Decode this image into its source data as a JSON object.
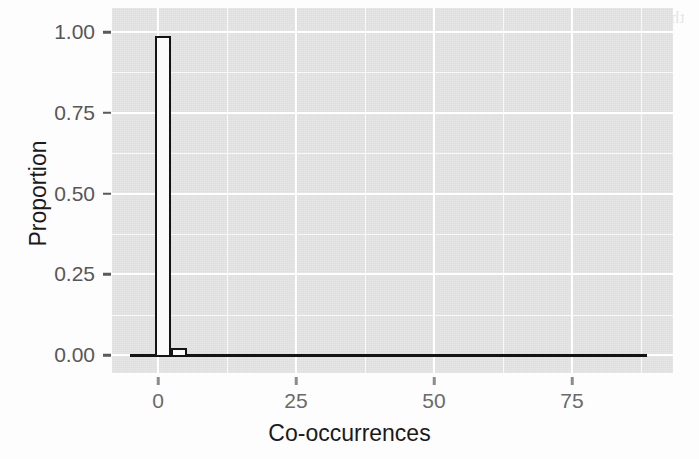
{
  "chart_data": {
    "type": "bar",
    "title": "",
    "subtitle": "",
    "xlabel": "Co-occurrences",
    "ylabel": "Proportion",
    "xlim": [
      -2.5,
      90
    ],
    "ylim": [
      -0.02,
      1.03
    ],
    "grid": true,
    "legend": null,
    "legend_position": "none",
    "x_ticks": [
      0,
      25,
      50,
      75
    ],
    "x_tick_labels": [
      "0",
      "25",
      "50",
      "75"
    ],
    "x_minor_ticks": [
      12.5,
      37.5,
      62.5,
      87.5
    ],
    "y_ticks": [
      0.0,
      0.25,
      0.5,
      0.75,
      1.0
    ],
    "y_tick_labels": [
      "0.00",
      "0.25",
      "0.50",
      "0.75",
      "1.00"
    ],
    "y_minor_ticks": [
      0.125,
      0.375,
      0.625,
      0.875
    ],
    "bin_width": 2.5,
    "bars": [
      {
        "x_start": -0.5,
        "x_end": 2.3,
        "value": 0.988
      },
      {
        "x_start": 2.3,
        "x_end": 5.2,
        "value": 0.012
      },
      {
        "x_start": 5.2,
        "x_end": 88.5,
        "value": 0.0
      }
    ],
    "categories": [
      "0-2.5",
      "2.5-5",
      "5-88.5"
    ],
    "values": [
      0.988,
      0.012,
      0.0
    ],
    "annotations": [],
    "style": {
      "panel_background": "#e4e4e4",
      "gridline_color": "#ffffff",
      "bar_outline_color": "#141414",
      "bar_fill_color": "#fbfbfb",
      "tick_label_color": "#6a6a6a",
      "axis_title_color": "#1a1a1a",
      "page_background": "#ffffff"
    }
  },
  "background_ghost_text": {
    "note": "faint reversed bleed-through from the opposite page of the scan",
    "lines": [
      "the latest research on the topic of co-occurrence",
      "and significant results for the model table",
      "with a 0.05 threshold for each of the values",
      "NP 12) state for size 1.5) w",
      "but the number of terms in the set",
      "for the purposes of this analysis"
    ]
  }
}
